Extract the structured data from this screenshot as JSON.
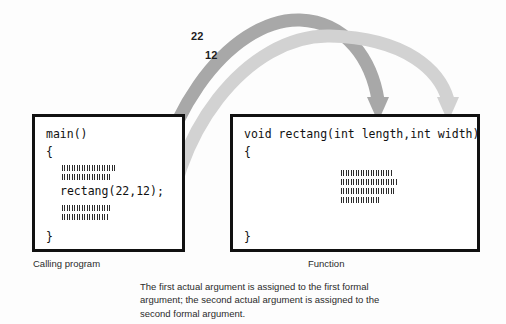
{
  "figure": {
    "background_color": "#fdfdfd"
  },
  "arrows": {
    "first_argument": {
      "label": "22",
      "color": "#a8a8a8",
      "source": "first actual argument",
      "target": "length"
    },
    "second_argument": {
      "label": "12",
      "color": "#d2d2d2",
      "source": "second actual argument",
      "target": "width"
    }
  },
  "calling_program": {
    "caption": "Calling program",
    "code": [
      "main()",
      "{",
      "rectang(22,12);",
      "}"
    ],
    "illegible_lines_above": 2,
    "illegible_lines_below": 2
  },
  "function": {
    "caption": "Function",
    "code": [
      "void rectang(int length,int width)",
      "{",
      "}"
    ],
    "illegible_lines": 4
  },
  "explanation": {
    "text": "The first actual argument is assigned to the first formal argument; the second actual argument is assigned to the second formal argument."
  }
}
